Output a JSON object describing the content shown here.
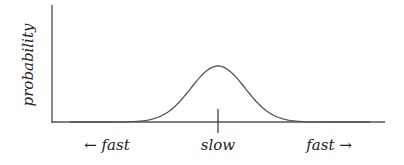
{
  "figure": {
    "type": "diagram",
    "y_axis_label": "probability",
    "x_labels": {
      "left": "← fast",
      "center": "slow",
      "right": "fast →"
    },
    "colors": {
      "line": "#555555",
      "axis": "#555555",
      "text": "#222222",
      "background": "#ffffff"
    },
    "curve": {
      "shape": "gaussian",
      "peak_x": 218,
      "peak_y": 66,
      "baseline_y": 122,
      "sigma_px": 27,
      "x_start": 52,
      "x_end": 385
    }
  }
}
